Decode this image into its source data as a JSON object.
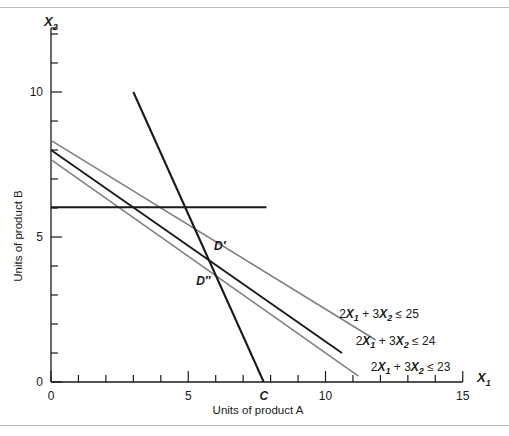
{
  "chart_data": {
    "type": "line",
    "title": "",
    "xlabel": "Units of product A",
    "ylabel": "Units of product B",
    "x_axis_name": "X",
    "x_axis_sub": "1",
    "y_axis_name": "X",
    "y_axis_sub": "2",
    "xlim": [
      0,
      15
    ],
    "ylim": [
      0,
      12
    ],
    "x_ticks": [
      0,
      1,
      2,
      3,
      4,
      5,
      6,
      7,
      8,
      9,
      10,
      11,
      12,
      13,
      14,
      15
    ],
    "x_tick_labels": [
      "0",
      "",
      "",
      "",
      "",
      "5",
      "",
      "",
      "",
      "",
      "10",
      "",
      "",
      "",
      "",
      "15"
    ],
    "y_ticks": [
      0,
      1,
      2,
      3,
      4,
      5,
      6,
      7,
      8,
      9,
      10,
      11,
      12
    ],
    "y_tick_labels": [
      "0",
      "",
      "",
      "",
      "",
      "5",
      "",
      "",
      "",
      "",
      "10",
      "",
      ""
    ],
    "grid": false,
    "legend_position": "inline-annotations",
    "series": [
      {
        "name": "2X1 + 3X2 <= 25",
        "label_text": "2X1 + 3X2 ≤ 25",
        "label_parts": [
          "2",
          "X",
          "1",
          " + 3",
          "X",
          "2",
          " ≤ 25"
        ],
        "color": "#808080",
        "style": "solid",
        "width": 1.6,
        "intercept_x2": 8.333,
        "intercept_x1": 12.5,
        "drawn_from": [
          0,
          8.333
        ],
        "drawn_to": [
          11.83,
          1.45
        ],
        "label_value": 25
      },
      {
        "name": "2X1 + 3X2 <= 24",
        "label_text": "2X1 + 3X2 ≤ 24",
        "label_parts": [
          "2",
          "X",
          "1",
          " + 3",
          "X",
          "2",
          " ≤ 24"
        ],
        "color": "#1a1a1a",
        "style": "solid",
        "width": 1.9,
        "intercept_x2": 8.0,
        "intercept_x1": 12.0,
        "drawn_from": [
          0,
          8.0
        ],
        "drawn_to": [
          10.6,
          1.0
        ],
        "label_value": 24
      },
      {
        "name": "2X1 + 3X2 <= 23",
        "label_text": "2X1 + 3X2 ≤ 23",
        "label_parts": [
          "2",
          "X",
          "1",
          " + 3",
          "X",
          "2",
          " ≤ 23"
        ],
        "color": "#808080",
        "style": "solid",
        "width": 1.6,
        "intercept_x2": 7.667,
        "intercept_x1": 11.5,
        "drawn_from": [
          0,
          7.667
        ],
        "drawn_to": [
          11.2,
          0.2
        ],
        "label_value": 23
      },
      {
        "name": "steep-constraint",
        "label_text": "",
        "color": "#1a1a1a",
        "style": "solid",
        "width": 2.1,
        "drawn_from": [
          3.0,
          10.0
        ],
        "drawn_to": [
          7.75,
          0.0
        ]
      },
      {
        "name": "horizontal-constraint",
        "label_text": "",
        "color": "#1a1a1a",
        "style": "solid",
        "width": 2.0,
        "drawn_from": [
          0.0,
          6.03
        ],
        "drawn_to": [
          7.85,
          6.03
        ]
      }
    ],
    "annotations": [
      {
        "name": "point-d-prime",
        "text": "D′",
        "x": 6.15,
        "y": 4.55
      },
      {
        "name": "point-d-double-prime",
        "text": "D″",
        "x": 5.55,
        "y": 3.35
      },
      {
        "name": "point-c",
        "text": "C",
        "x": 7.75,
        "y": -0.62
      }
    ],
    "constraint_label_positions": [
      {
        "series": 0,
        "x": 11.95,
        "y": 2.22
      },
      {
        "series": 1,
        "x": 12.55,
        "y": 1.28
      },
      {
        "series": 2,
        "x": 13.1,
        "y": 0.38
      }
    ]
  },
  "colors": {
    "axis": "#1a1a1a",
    "gray_line": "#808080",
    "black_line": "#1a1a1a",
    "frame_rule": "#b9bcbe",
    "background": "#ffffff"
  }
}
